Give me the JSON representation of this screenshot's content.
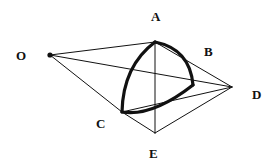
{
  "figure": {
    "title": "",
    "background_color": "#ffffff",
    "stroke_color": "#111111",
    "thin_stroke_width": 1,
    "thick_stroke_width": 3.2,
    "width": 277,
    "height": 168
  },
  "labels": {
    "O": "O",
    "A": "A",
    "B": "B",
    "C": "C",
    "D": "D",
    "E": "E"
  },
  "points": {
    "O": {
      "x": 50,
      "y": 55,
      "label_x": 16,
      "label_y": 49,
      "dot": true
    },
    "A": {
      "x": 155,
      "y": 42,
      "label_x": 151,
      "label_y": 10,
      "dot": false
    },
    "B": {
      "x": 193,
      "y": 85,
      "label_x": 204,
      "label_y": 45,
      "dot": false
    },
    "C": {
      "x": 122,
      "y": 112,
      "label_x": 96,
      "label_y": 117,
      "dot": false
    },
    "D": {
      "x": 232,
      "y": 87,
      "label_x": 252,
      "label_y": 88,
      "dot": false
    },
    "E": {
      "x": 155,
      "y": 133,
      "label_x": 149,
      "label_y": 147,
      "dot": false
    }
  },
  "thin_edges": [
    {
      "name": "O-A",
      "from": "O",
      "to": "A"
    },
    {
      "name": "O-D",
      "from": "O",
      "to": "D"
    },
    {
      "name": "O-C",
      "from": "O",
      "to": "C"
    },
    {
      "name": "C-E",
      "from": "C",
      "to": "E"
    },
    {
      "name": "A-E",
      "from": "A",
      "to": "E"
    },
    {
      "name": "A-D",
      "from": "A",
      "to": "D"
    },
    {
      "name": "E-D",
      "from": "E",
      "to": "D"
    },
    {
      "name": "C-D",
      "from": "C",
      "to": "D"
    }
  ],
  "thick_arcs": [
    {
      "name": "arc-A-B",
      "from": "A",
      "to": "B",
      "control_x": 190,
      "control_y": 49,
      "bulge": "outward-right"
    },
    {
      "name": "arc-B-C",
      "from": "B",
      "to": "C",
      "control_x": 152,
      "control_y": 117,
      "bulge": "downward"
    },
    {
      "name": "arc-C-A",
      "from": "C",
      "to": "A",
      "control_x": 123,
      "control_y": 66,
      "bulge": "outward-left"
    }
  ]
}
